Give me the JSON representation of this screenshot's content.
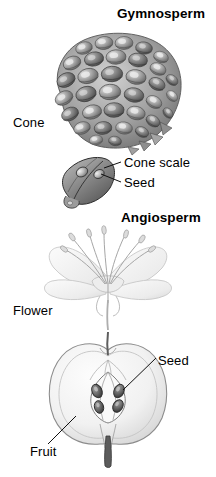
{
  "figure": {
    "background_color": "#ffffff",
    "ink_color": "#000000"
  },
  "sections": [
    {
      "id": "gymnosperm",
      "heading": "Gymnosperm",
      "illustrations": [
        {
          "id": "cone",
          "name": "pine-cone",
          "label": "Cone",
          "description": "Ovoid pine cone made of overlapping woody scales, shaded gray"
        },
        {
          "id": "cone-scale-detail",
          "name": "cone-scale-with-seeds",
          "description": "Single detached cone scale, angled lozenge shape, bearing two seeds",
          "callouts": [
            {
              "label": "Cone scale",
              "target": "scale-surface"
            },
            {
              "label": "Seed",
              "target": "seed-on-scale"
            }
          ]
        }
      ]
    },
    {
      "id": "angiosperm",
      "heading": "Angiosperm",
      "illustrations": [
        {
          "id": "flower",
          "name": "flower",
          "label": "Flower",
          "description": "Pale lily-like flower with spreading petals and radiating stamens tipped by anthers"
        },
        {
          "id": "fruit",
          "name": "apple-cross-section",
          "description": "Apple cut in longitudinal half showing flesh, core carpels and seeds",
          "callouts": [
            {
              "label": "Seed",
              "target": "apple-seed"
            },
            {
              "label": "Fruit",
              "target": "apple-flesh"
            }
          ]
        }
      ]
    },
    {
      "id": "colors",
      "heading": "",
      "illustrations": []
    }
  ],
  "labels": {
    "gymnosperm": "Gymnosperm",
    "angiosperm": "Angiosperm",
    "cone": "Cone",
    "cone_scale": "Cone scale",
    "seed_cone": "Seed",
    "flower": "Flower",
    "seed_fruit": "Seed",
    "fruit": "Fruit"
  },
  "colors": {
    "text": "#000000",
    "background": "#ffffff",
    "cone_mid": "#9a9a9a",
    "cone_dark": "#4f4f4f",
    "cone_light": "#d8d8d8",
    "scale_mid": "#8d8d8d",
    "flower_pale": "#e2e2e2",
    "flower_line": "#b4b4b4",
    "fruit_flesh": "#f2f2f2",
    "fruit_line": "#909090",
    "seed_dark": "#5a5a5a",
    "leader_line": "#1a1a1a"
  }
}
